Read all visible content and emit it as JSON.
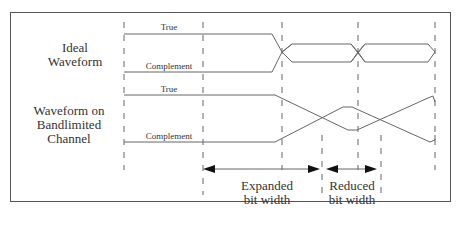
{
  "diagram": {
    "rows": [
      {
        "label_line1": "Ideal",
        "label_line2": "Waveform",
        "true_label": "True",
        "complement_label": "Complement"
      },
      {
        "label_line1": "Waveform on",
        "label_line2": "Bandlimited Channel",
        "true_label": "True",
        "complement_label": "Complement"
      }
    ],
    "annotations": {
      "expanded_line1": "Expanded",
      "expanded_line2": "bit width",
      "reduced_line1": "Reduced",
      "reduced_line2": "bit width"
    },
    "colors": {
      "line": "#555555",
      "frame": "#555555",
      "text": "#333333"
    }
  }
}
